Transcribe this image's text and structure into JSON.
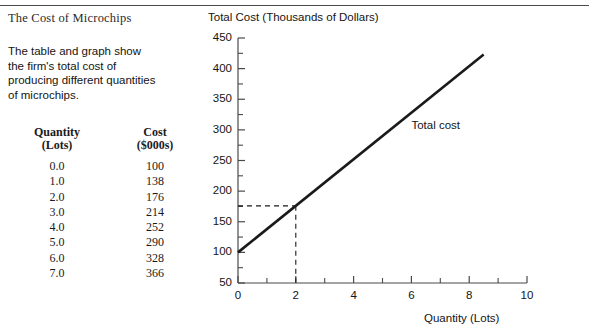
{
  "panel": {
    "title": "The Cost of Microchips",
    "description": "The table and graph show the firm's total cost of producing different quantities of microchips."
  },
  "table": {
    "headers": [
      {
        "line1": "Quantity",
        "line2": "(Lots)"
      },
      {
        "line1": "Cost",
        "line2": "($000s)"
      }
    ],
    "rows": [
      {
        "quantity": "0.0",
        "cost": "100"
      },
      {
        "quantity": "1.0",
        "cost": "138"
      },
      {
        "quantity": "2.0",
        "cost": "176"
      },
      {
        "quantity": "3.0",
        "cost": "214"
      },
      {
        "quantity": "4.0",
        "cost": "252"
      },
      {
        "quantity": "5.0",
        "cost": "290"
      },
      {
        "quantity": "6.0",
        "cost": "328"
      },
      {
        "quantity": "7.0",
        "cost": "366"
      }
    ]
  },
  "chart_data": {
    "type": "line",
    "title": "",
    "ylabel": "Total Cost (Thousands of Dollars)",
    "xlabel": "Quantity (Lots)",
    "xlim": [
      0,
      10
    ],
    "ylim": [
      50,
      450
    ],
    "x_ticks": [
      0,
      2,
      4,
      6,
      8,
      10
    ],
    "x_tick_labels": [
      "0",
      "2",
      "4",
      "6",
      "8",
      "10"
    ],
    "x_minor_ticks": [
      1,
      3,
      5,
      7,
      9
    ],
    "y_ticks": [
      50,
      100,
      150,
      200,
      250,
      300,
      350,
      400,
      450
    ],
    "y_tick_labels": [
      "50",
      "100",
      "150",
      "200",
      "250",
      "300",
      "350",
      "400",
      "450"
    ],
    "y_minor_ticks": [
      75,
      125,
      175,
      225,
      275,
      325,
      375,
      425
    ],
    "grid": false,
    "series": [
      {
        "name": "Total cost",
        "x": [
          0,
          8.5
        ],
        "y": [
          100,
          423
        ],
        "color": "#1a1a1a"
      }
    ],
    "annotations": [
      {
        "name": "series-label",
        "text": "Total cost",
        "x": 6.0,
        "y": 305
      }
    ],
    "guide_lines": [
      {
        "name": "guide-horizontal",
        "from": [
          0,
          176
        ],
        "to": [
          2,
          176
        ],
        "style": "dashed"
      },
      {
        "name": "guide-vertical",
        "from": [
          2,
          176
        ],
        "to": [
          2,
          50
        ],
        "style": "dashed"
      }
    ]
  },
  "colors": {
    "line": "#1a1a1a",
    "axis": "#4a4a4a",
    "rule": "#4a4a4a",
    "text": "#141414",
    "background": "#ffffff"
  }
}
